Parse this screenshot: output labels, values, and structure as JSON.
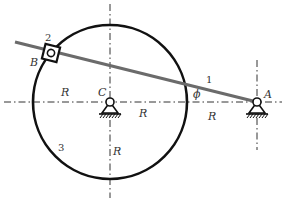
{
  "diagram": {
    "type": "mechanism",
    "colors": {
      "circle": "#111111",
      "rod": "#6b6b6b",
      "centerline": "#333333",
      "background": "#ffffff"
    },
    "points": {
      "A": "A",
      "B": "B",
      "C": "C"
    },
    "links": {
      "rod": "1",
      "slider": "2",
      "ring": "3"
    },
    "angle": "ϕ",
    "dimensions": {
      "r_left": "R",
      "r_center_right": "R",
      "r_right": "R",
      "r_down": "R"
    }
  }
}
